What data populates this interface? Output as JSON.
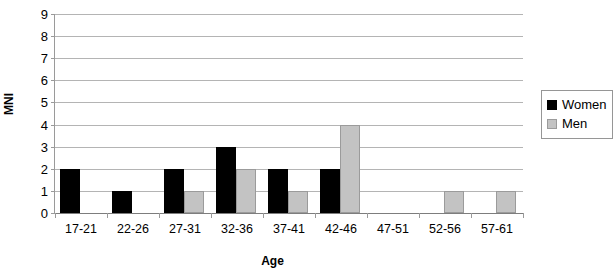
{
  "chart_data": {
    "type": "bar",
    "title": "",
    "xlabel": "Age",
    "ylabel": "MNI",
    "categories": [
      "17-21",
      "22-26",
      "27-31",
      "32-36",
      "37-41",
      "42-46",
      "47-51",
      "52-56",
      "57-61"
    ],
    "series": [
      {
        "name": "Women",
        "color": "#000000",
        "values": [
          2,
          1,
          2,
          3,
          2,
          2,
          0,
          0,
          0
        ]
      },
      {
        "name": "Men",
        "color": "#c3c3c3",
        "values": [
          0,
          0,
          1,
          2,
          1,
          4,
          0,
          1,
          1
        ]
      }
    ],
    "ylim": [
      0,
      9
    ],
    "yticks": [
      0,
      1,
      2,
      3,
      4,
      5,
      6,
      7,
      8,
      9
    ],
    "ytick_labels": [
      "0",
      "1",
      "2",
      "3",
      "4",
      "5",
      "6",
      "7",
      "8",
      "9"
    ],
    "grid": true,
    "grid_axis": "y",
    "legend_position": "right",
    "legend_entries": [
      "Women",
      "Men"
    ]
  }
}
